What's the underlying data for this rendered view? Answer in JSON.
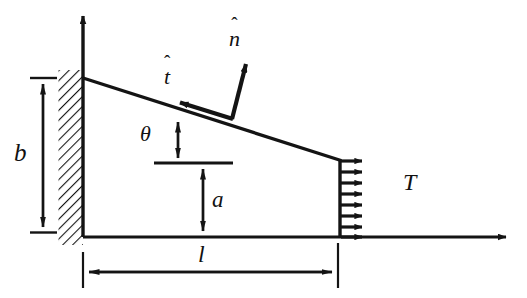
{
  "figure": {
    "ink_color": "#141414",
    "background_color": "#ffffff"
  },
  "labels": {
    "b": "b",
    "a": "a",
    "l": "l",
    "T": "T",
    "theta": "θ",
    "n_hat_accent": "ˆ",
    "n_hat_base": "n",
    "t_hat_accent": "ˆ",
    "t_hat_base": "t"
  },
  "geometry": {
    "fixed_wall": {
      "x": 58,
      "y": 70,
      "width": 25,
      "height": 175,
      "hatch_angle_deg": 45
    },
    "vertical_axis": {
      "x": 83,
      "y_top": 10,
      "y_bottom": 237
    },
    "baseline_axis": {
      "y": 237,
      "x_left": 83,
      "x_right": 512
    },
    "inclined_edge": {
      "x1": 83,
      "y1": 78,
      "x2": 340,
      "y2": 160
    },
    "traction_face": {
      "x": 340,
      "y_top": 160,
      "y_bottom": 237
    },
    "traction_arrow_count": 8,
    "traction_arrow_length": 28,
    "dimension_b": {
      "x": 43,
      "y_top": 78,
      "y_bottom": 232
    },
    "dimension_a": {
      "x": 203,
      "y_top": 163,
      "y_bottom": 237
    },
    "dimension_l": {
      "y": 272,
      "x_left": 83,
      "x_right": 338
    },
    "angle_marker": {
      "x": 178,
      "y_top": 120,
      "y_bottom": 163
    },
    "reference_line": {
      "y": 163,
      "x_left": 155,
      "x_right": 232
    },
    "n_hat_vector": {
      "x1": 232,
      "y1": 118,
      "x2": 246,
      "y2": 58
    },
    "t_hat_vector": {
      "x1": 232,
      "y1": 118,
      "x2": 175,
      "y2": 101
    }
  }
}
